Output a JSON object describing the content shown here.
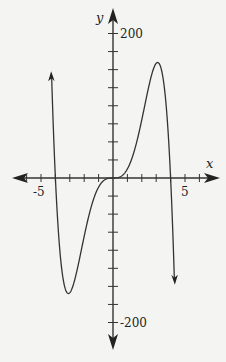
{
  "chart_data": {
    "type": "line",
    "title": "",
    "xlabel": "x",
    "ylabel": "y",
    "xlim": [
      -6.5,
      6.5
    ],
    "ylim": [
      -225,
      225
    ],
    "grid": false,
    "x_tick_step": 1,
    "y_tick_step": 25,
    "x_tick_labels": [
      {
        "value": -5,
        "label": "-5"
      },
      {
        "value": 5,
        "label": "5"
      }
    ],
    "y_tick_labels": [
      {
        "value": 200,
        "label": "200"
      },
      {
        "value": -200,
        "label": "-200"
      }
    ],
    "function_description": "odd quintic through (-4,0), (0,0), (4,0); local max near (3,160), local min near (-3,-160)",
    "series": [
      {
        "name": "f(x)",
        "x": [
          -4.4,
          -4.2,
          -4.0,
          -3.8,
          -3.5,
          -3.2,
          -3.0,
          -2.8,
          -2.5,
          -2.0,
          -1.5,
          -1.0,
          -0.5,
          0,
          0.5,
          1.0,
          1.5,
          2.0,
          2.5,
          2.8,
          3.0,
          3.2,
          3.5,
          3.8,
          4.0,
          4.2,
          4.4
        ],
        "y": [
          256,
          115,
          0,
          -72,
          -140,
          -160,
          -159,
          -151,
          -120,
          -81,
          -39,
          -13,
          -2,
          0,
          2,
          13,
          39,
          81,
          120,
          151,
          159,
          160,
          140,
          72,
          0,
          -115,
          -256
        ]
      }
    ],
    "arrows": {
      "left_branch": "up",
      "right_branch": "down"
    }
  }
}
